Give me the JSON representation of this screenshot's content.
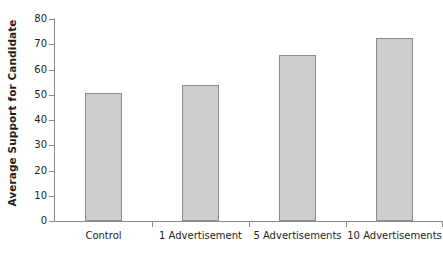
{
  "chart_data": {
    "type": "bar",
    "title": "",
    "xlabel": "",
    "ylabel": "Average Support for Candidate",
    "categories": [
      "Control",
      "1 Advertisement",
      "5 Advertisements",
      "10 Advertisements"
    ],
    "values": [
      50.5,
      54,
      65.8,
      72.5
    ],
    "ylim": [
      0,
      80
    ],
    "ytick_labels": [
      "0",
      "10",
      "20",
      "30",
      "40",
      "50",
      "60",
      "70",
      "80"
    ],
    "ytick_values": [
      0,
      10,
      20,
      30,
      40,
      50,
      60,
      70,
      80
    ],
    "grid": false,
    "legend": "none",
    "bar_fill_color": "#cdcdcd",
    "bar_border_color": "#8c8c8c",
    "axis_color": "#8a8a8a",
    "text_color": "#231f20",
    "background_color": "#ffffff"
  }
}
